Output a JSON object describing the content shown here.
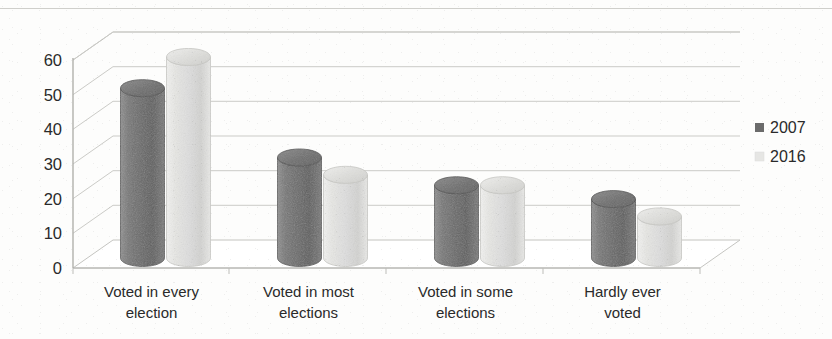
{
  "chart_data": {
    "type": "bar",
    "title": "",
    "subtitle": "",
    "xlabel": "",
    "ylabel": "",
    "categories": [
      "Voted in every election",
      "Voted in most elections",
      "Voted in some elections",
      "Hardly ever voted"
    ],
    "category_lines": [
      [
        "Voted in every",
        "election"
      ],
      [
        "Voted in most",
        "elections"
      ],
      [
        "Voted in some",
        "elections"
      ],
      [
        "Hardly ever",
        "voted"
      ]
    ],
    "series": [
      {
        "name": "2007",
        "values": [
          49,
          29,
          21,
          17
        ],
        "color": "#6b6b6b"
      },
      {
        "name": "2016",
        "values": [
          58,
          24,
          21,
          12
        ],
        "color": "#e3e3e1"
      }
    ],
    "ylim": [
      0,
      60
    ],
    "ytick_values": [
      0,
      10,
      20,
      30,
      40,
      50,
      60
    ],
    "ytick_labels": [
      "0",
      "10",
      "20",
      "30",
      "40",
      "50",
      "60"
    ],
    "grid": true,
    "grid_axis": "y",
    "legend_position": "right",
    "legend": [
      {
        "label": "2007",
        "marker": "square",
        "color": "#6b6b6b"
      },
      {
        "label": "2016",
        "marker": "square",
        "color": "#e6e6e4"
      }
    ],
    "style": "3d-cylinder",
    "palette": {
      "series_2007": "#6b6b6b",
      "series_2016": "#e3e3e1",
      "gridline": "#c9c9c5",
      "axis": "#b9b9b4",
      "text": "#2a2a2a",
      "background": "#fdfdfc"
    }
  }
}
